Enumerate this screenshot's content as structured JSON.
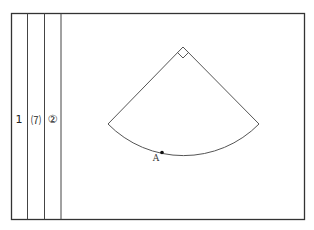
{
  "diagram": {
    "strips": [
      {
        "id": "strip-1",
        "label": "1"
      },
      {
        "id": "strip-7",
        "label": "⑺"
      },
      {
        "id": "strip-2",
        "label": "②"
      }
    ],
    "sector": {
      "angle": "right-angle",
      "point_label": "A"
    },
    "colors": {
      "line": "#333333",
      "background": "#ffffff"
    }
  }
}
